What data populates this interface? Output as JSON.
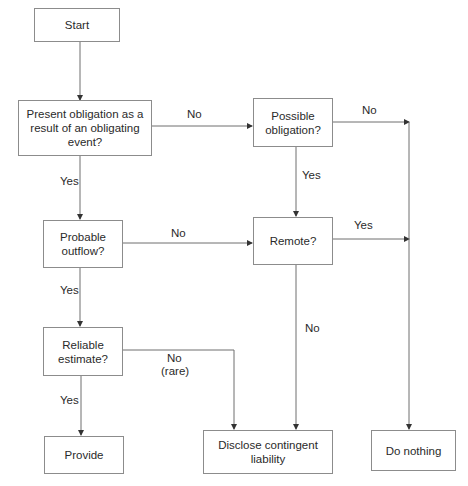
{
  "diagram": {
    "nodes": {
      "start": "Start",
      "present_obligation": "Present obligation as a result of an obligating event?",
      "possible_obligation": "Possible obligation?",
      "probable_outflow": "Probable outflow?",
      "remote": "Remote?",
      "reliable_estimate": "Reliable estimate?",
      "provide": "Provide",
      "disclose": "Disclose contingent liability",
      "do_nothing": "Do nothing"
    },
    "edge_labels": {
      "present_no": "No",
      "present_yes": "Yes",
      "possible_no": "No",
      "possible_yes": "Yes",
      "probable_no": "No",
      "probable_yes": "Yes",
      "remote_yes": "Yes",
      "remote_no": "No",
      "reliable_no": "No",
      "reliable_no_note": "(rare)",
      "reliable_yes": "Yes"
    },
    "colors": {
      "line": "#6e6e6e",
      "border": "#8c8c8c",
      "text": "#2a2a2a"
    }
  }
}
